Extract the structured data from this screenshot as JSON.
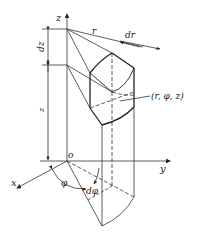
{
  "diagram": {
    "type": "cylindrical-coordinate-volume-element",
    "labels": {
      "z_axis": "z",
      "y_axis": "y",
      "x_axis": "x",
      "origin": "o",
      "radius": "r",
      "dr": "dr",
      "dz": "dz",
      "z_height": "z",
      "phi": "φ",
      "dphi": "dφ",
      "point": "(r, φ, z)"
    }
  }
}
